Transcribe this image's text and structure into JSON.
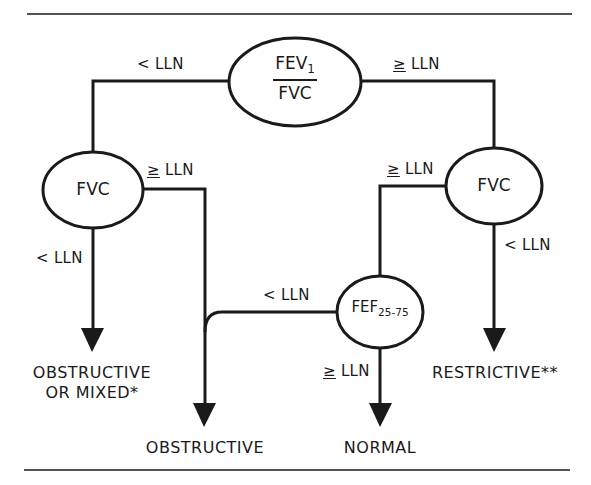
{
  "diagram": {
    "type": "decision-flowchart",
    "colors": {
      "stroke": "#1a1a1a",
      "background": "#ffffff"
    },
    "nodes": {
      "root": {
        "numerator": "FEV",
        "numerator_sub": "1",
        "denominator": "FVC"
      },
      "left_fvc": {
        "label": "FVC"
      },
      "right_fvc": {
        "label": "FVC"
      },
      "fef": {
        "label": "FEF",
        "sub": "25-75"
      }
    },
    "edges": {
      "root_lt": {
        "symbol": "<",
        "text": "LLN"
      },
      "root_ge": {
        "symbol": "≥",
        "text": "LLN"
      },
      "left_fvc_ge": {
        "symbol": "≥",
        "text": "LLN"
      },
      "left_fvc_lt": {
        "symbol": "<",
        "text": "LLN"
      },
      "right_fvc_ge": {
        "symbol": "≥",
        "text": "LLN"
      },
      "right_fvc_lt": {
        "symbol": "<",
        "text": "LLN"
      },
      "fef_lt": {
        "symbol": "<",
        "text": "LLN"
      },
      "fef_ge": {
        "symbol": "≥",
        "text": "LLN"
      }
    },
    "outcomes": {
      "obstructive_mixed_line1": "OBSTRUCTIVE",
      "obstructive_mixed_line2": "OR MIXED*",
      "obstructive": "OBSTRUCTIVE",
      "normal": "NORMAL",
      "restrictive": "RESTRICTIVE**"
    }
  }
}
